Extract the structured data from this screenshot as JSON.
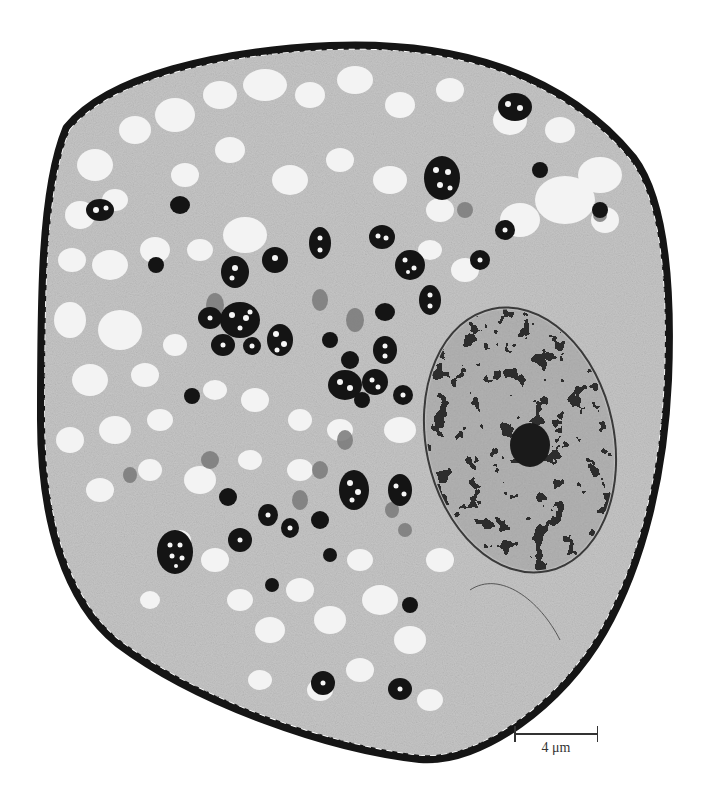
{
  "figure": {
    "type": "transmission electron micrograph",
    "colors": {
      "background": "#ffffff",
      "cell_wall": "#1a1a1a",
      "cytoplasm": "#c8c8c8",
      "vacuole": "#f2f2f2",
      "dense_body": "#141414",
      "nucleus": "#8a8a8a",
      "chromatin": "#1e1e1e"
    }
  },
  "scale_bar": {
    "label": "4 μm",
    "length_px": 84
  }
}
